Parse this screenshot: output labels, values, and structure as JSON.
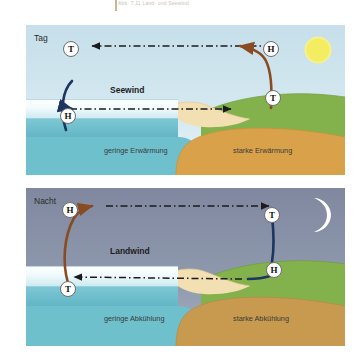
{
  "figure": {
    "caption": "Abb. 7.11 Land- und Seewind",
    "language": "de"
  },
  "colors": {
    "day_sky": "#cfe4ed",
    "night_sky": "#8b93a8",
    "sea_surface_layer": "#eef7fa",
    "sea_deep": "#74c2cf",
    "sand_underwater": "#e0a84c",
    "beach": "#f0dcae",
    "land_green": "#7fb04a",
    "ground_brown": "#c79a4f",
    "warm_arrow": "#8a4a22",
    "cold_arrow": "#1d3560",
    "dashed_arrow": "#1b1b1b",
    "sun": "#f2ea6a",
    "moon": "#ffffff",
    "marker_fill": "#ffffff",
    "marker_stroke": "#6d6d6d"
  },
  "panels": [
    {
      "id": "day",
      "time_label": "Tag",
      "wind_label": "Seewind",
      "sky_icon": "sun-icon",
      "markers": [
        {
          "id": "sea-upper",
          "letter": "T",
          "x": 63,
          "y": 41
        },
        {
          "id": "sea-lower",
          "letter": "H",
          "x": 60,
          "y": 108
        },
        {
          "id": "land-upper",
          "letter": "H",
          "x": 263,
          "y": 41
        },
        {
          "id": "land-lower",
          "letter": "T",
          "x": 265,
          "y": 90
        }
      ],
      "ground_labels": [
        {
          "id": "sea-heating",
          "text": "geringe Erwärmung"
        },
        {
          "id": "land-heating",
          "text": "starke Erwärmung"
        }
      ],
      "flow": {
        "upper_direction": "right-to-left",
        "lower_direction": "left-to-right",
        "upper_arrow_style": "dash-dot",
        "lower_arrow_style": "dash-dot"
      }
    },
    {
      "id": "night",
      "time_label": "Nacht",
      "wind_label": "Landwind",
      "sky_icon": "moon-icon",
      "markers": [
        {
          "id": "sea-upper",
          "letter": "H",
          "x": 62,
          "y": 202
        },
        {
          "id": "sea-lower",
          "letter": "T",
          "x": 60,
          "y": 281
        },
        {
          "id": "land-upper",
          "letter": "T",
          "x": 264,
          "y": 207
        },
        {
          "id": "land-lower",
          "letter": "H",
          "x": 266,
          "y": 262
        }
      ],
      "ground_labels": [
        {
          "id": "sea-cooling",
          "text": "geringe Abkühlung"
        },
        {
          "id": "land-cooling",
          "text": "starke Abkühlung"
        }
      ],
      "flow": {
        "upper_direction": "left-to-right",
        "lower_direction": "right-to-left",
        "upper_arrow_style": "dash-dot",
        "lower_arrow_style": "dash-dot"
      }
    }
  ]
}
